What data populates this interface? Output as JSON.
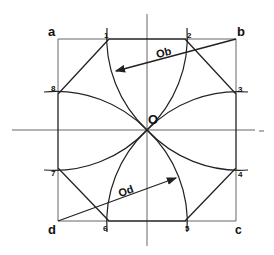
{
  "diagram": {
    "title": "",
    "colors": {
      "line": "#222222",
      "axis": "#555555",
      "background": "#ffffff"
    },
    "corners": [
      {
        "id": "a",
        "label": "a",
        "x": 58,
        "y": 39
      },
      {
        "id": "b",
        "label": "b",
        "x": 236,
        "y": 39
      },
      {
        "id": "c",
        "label": "c",
        "x": 236,
        "y": 221
      },
      {
        "id": "d",
        "label": "d",
        "x": 58,
        "y": 221
      }
    ],
    "center": {
      "label": "O",
      "x": 147,
      "y": 130
    },
    "points": [
      {
        "label": "1",
        "x": 109,
        "y": 39
      },
      {
        "label": "2",
        "x": 185,
        "y": 39
      },
      {
        "label": "3",
        "x": 236,
        "y": 94
      },
      {
        "label": "4",
        "x": 236,
        "y": 168
      },
      {
        "label": "5",
        "x": 185,
        "y": 221
      },
      {
        "label": "6",
        "x": 109,
        "y": 221
      },
      {
        "label": "7",
        "x": 58,
        "y": 168
      },
      {
        "label": "8",
        "x": 58,
        "y": 94
      }
    ],
    "radius_labels": [
      {
        "label": "Ob",
        "from": "b",
        "to_arc": "1-O"
      },
      {
        "label": "Od",
        "from": "d",
        "to_arc": "5-O"
      }
    ],
    "arcs": [
      {
        "center": "a",
        "through": [
          "2",
          "O",
          "7"
        ]
      },
      {
        "center": "b",
        "through": [
          "1",
          "O",
          "4"
        ]
      },
      {
        "center": "c",
        "through": [
          "3",
          "O",
          "6"
        ]
      },
      {
        "center": "d",
        "through": [
          "8",
          "O",
          "5"
        ]
      }
    ],
    "octagon": [
      "1",
      "2",
      "3",
      "4",
      "5",
      "6",
      "7",
      "8"
    ]
  }
}
